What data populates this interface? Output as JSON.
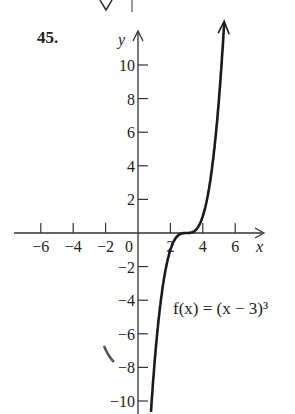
{
  "problem_number": "45.",
  "chart_data": {
    "type": "line",
    "title": "",
    "function_label": "f(x) = (x − 3)³",
    "xlabel": "x",
    "ylabel": "y",
    "xlim": [
      -7.5,
      8
    ],
    "ylim": [
      -11,
      12
    ],
    "x_ticks": [
      -6,
      -4,
      -2,
      0,
      2,
      4,
      6
    ],
    "y_ticks": [
      -10,
      -8,
      -6,
      -4,
      -2,
      2,
      4,
      6,
      8,
      10
    ],
    "grid": false,
    "series": [
      {
        "name": "f(x) = (x - 3)^3",
        "x": [
          0.8,
          1,
          1.5,
          2,
          2.5,
          3,
          3.5,
          4,
          4.5,
          5,
          5.3
        ],
        "y": [
          -10.6,
          -8,
          -3.375,
          -1,
          -0.125,
          0,
          0.125,
          1,
          3.375,
          8,
          12.2
        ]
      }
    ]
  }
}
